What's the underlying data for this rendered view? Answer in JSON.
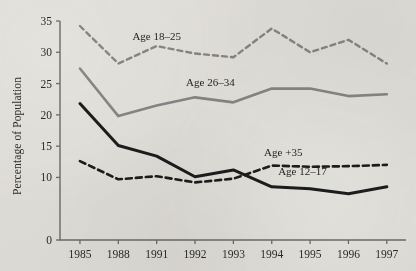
{
  "figure": {
    "ylabel": "Percentage of Population",
    "background_color": "#e9e8e4"
  },
  "chart_data": {
    "type": "line",
    "title": "",
    "xlabel": "",
    "ylabel": "Percentage of Population",
    "categories": [
      "1985",
      "1988",
      "1991",
      "1992",
      "1993",
      "1994",
      "1995",
      "1996",
      "1997"
    ],
    "x_tick_labels": [
      "1985",
      "1988",
      "1991",
      "1992",
      "1993",
      "1994",
      "1995",
      "1996",
      "1997"
    ],
    "y_tick_labels": [
      "0",
      "10",
      "15",
      "20",
      "25",
      "30",
      "35"
    ],
    "y_tick_values": [
      0,
      10,
      15,
      20,
      25,
      30,
      35
    ],
    "ylim": [
      0,
      35
    ],
    "grid": false,
    "legend_position": "inline-labels",
    "series": [
      {
        "name": "Age 18–25",
        "label": "Age 18–25",
        "style": "dashed",
        "color": "#8a8a8a",
        "values": [
          34.2,
          28.2,
          31.0,
          29.8,
          29.2,
          33.8,
          30.0,
          32.0,
          28.2
        ]
      },
      {
        "name": "Age 26–34",
        "label": "Age 26–34",
        "style": "solid",
        "color": "#8a8a8a",
        "values": [
          27.4,
          19.8,
          21.5,
          22.8,
          22.0,
          24.2,
          24.2,
          23.0,
          23.3
        ]
      },
      {
        "name": "Age +35",
        "label": "Age +35",
        "style": "dashed",
        "color": "#1d1d1d",
        "values": [
          12.6,
          9.7,
          10.2,
          9.2,
          9.8,
          11.9,
          11.7,
          11.8,
          12.0
        ]
      },
      {
        "name": "Age 12–17",
        "label": "Age 12–17",
        "style": "solid",
        "color": "#1d1d1d",
        "values": [
          21.8,
          15.1,
          13.4,
          10.1,
          11.2,
          8.5,
          8.2,
          7.4,
          8.5
        ]
      }
    ],
    "annotations": [
      {
        "text": "Age 18–25",
        "x": 1991,
        "y": 32.0
      },
      {
        "text": "Age 26–34",
        "x": 1992.4,
        "y": 24.6
      },
      {
        "text": "Age +35",
        "x": 1994.3,
        "y": 13.4
      },
      {
        "text": "Age 12–17",
        "x": 1994.8,
        "y": 10.4
      }
    ]
  }
}
